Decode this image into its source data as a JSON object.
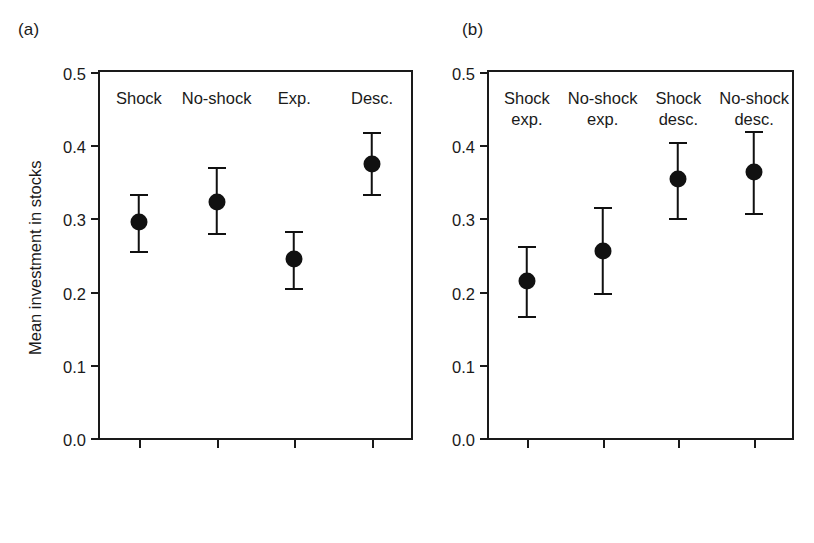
{
  "figure": {
    "background": "#ffffff",
    "ink_color": "#1a1a1a",
    "marker_color": "#111111"
  },
  "panels": [
    {
      "key": "a",
      "label": "(a)",
      "ylabel": "Mean investment in stocks",
      "show_ylabel": true
    },
    {
      "key": "b",
      "label": "(b)",
      "ylabel": "",
      "show_ylabel": false
    }
  ],
  "chart_data": [
    {
      "type": "scatter",
      "panel": "(a)",
      "title": "",
      "xlabel": "",
      "ylabel": "Mean investment in stocks",
      "ylim": [
        0.0,
        0.5
      ],
      "yticks": [
        "0.0",
        "0.1",
        "0.2",
        "0.3",
        "0.4",
        "0.5"
      ],
      "ytick_values": [
        0.0,
        0.1,
        0.2,
        0.3,
        0.4,
        0.5
      ],
      "grid": false,
      "legend": "none",
      "categories": [
        "Shock",
        "No-shock",
        "Exp.",
        "Desc."
      ],
      "category_lines": [
        [
          "Shock"
        ],
        [
          "No-shock"
        ],
        [
          "Exp."
        ],
        [
          "Desc."
        ]
      ],
      "values": [
        0.295,
        0.322,
        0.245,
        0.375
      ],
      "error_upper": [
        0.334,
        0.37,
        0.283,
        0.418
      ],
      "error_lower": [
        0.255,
        0.28,
        0.205,
        0.333
      ]
    },
    {
      "type": "scatter",
      "panel": "(b)",
      "title": "",
      "xlabel": "",
      "ylabel": "",
      "ylim": [
        0.0,
        0.5
      ],
      "yticks": [
        "0.0",
        "0.1",
        "0.2",
        "0.3",
        "0.4",
        "0.5"
      ],
      "ytick_values": [
        0.0,
        0.1,
        0.2,
        0.3,
        0.4,
        0.5
      ],
      "grid": false,
      "legend": "none",
      "categories": [
        "Shock exp.",
        "No-shock exp.",
        "Shock desc.",
        "No-shock desc."
      ],
      "category_lines": [
        [
          "Shock",
          "exp."
        ],
        [
          "No-shock",
          "exp."
        ],
        [
          "Shock",
          "desc."
        ],
        [
          "No-shock",
          "desc."
        ]
      ],
      "values": [
        0.214,
        0.256,
        0.354,
        0.364
      ],
      "error_upper": [
        0.262,
        0.316,
        0.404,
        0.42
      ],
      "error_lower": [
        0.166,
        0.198,
        0.301,
        0.307
      ]
    }
  ]
}
